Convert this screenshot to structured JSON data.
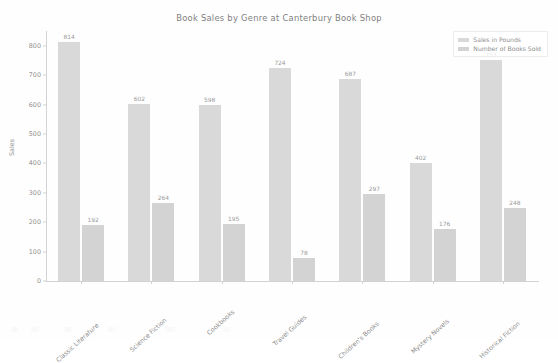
{
  "chart_data": {
    "type": "bar",
    "title": "Book Sales by Genre at Canterbury Book Shop",
    "xlabel": "",
    "ylabel": "Sales",
    "ylim": [
      0,
      850
    ],
    "yticks": [
      0,
      100,
      200,
      300,
      400,
      500,
      600,
      700,
      800
    ],
    "grid": false,
    "legend_position": "upper right",
    "categories": [
      "Classic Literature",
      "Science Fiction",
      "Cookbooks",
      "Travel Guides",
      "Children's Books",
      "Mystery Novels",
      "Historical Fiction"
    ],
    "series": [
      {
        "name": "Sales in Pounds",
        "color": "#d9d9d9",
        "values": [
          814,
          602,
          598,
          724,
          687,
          402,
          753
        ]
      },
      {
        "name": "Number of Books Sold",
        "color": "#d3d3d3",
        "values": [
          192,
          264,
          195,
          78,
          297,
          176,
          248
        ]
      }
    ],
    "data_labels_shown": true
  },
  "legend": {
    "entries": [
      {
        "label": "Sales in Pounds"
      },
      {
        "label": "Number of Books Sold"
      }
    ]
  },
  "axes": {
    "y_label": "Sales",
    "y_tick_labels": [
      "0",
      "100",
      "200",
      "300",
      "400",
      "500",
      "600",
      "700",
      "800"
    ]
  }
}
